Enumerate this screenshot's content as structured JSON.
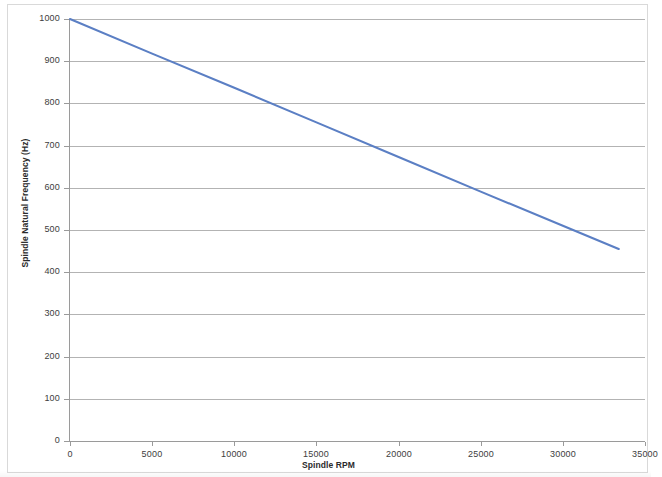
{
  "chart_data": {
    "type": "line",
    "title": "",
    "xlabel": "Spindle RPM",
    "ylabel": "Spindle Natural Frequency (Hz)",
    "xlim": [
      0,
      35000
    ],
    "ylim": [
      0,
      1000
    ],
    "grid": true,
    "legend": "none",
    "x_ticks": [
      "0",
      "5000",
      "10000",
      "15000",
      "20000",
      "25000",
      "30000",
      "35000"
    ],
    "x_tick_values": [
      0,
      5000,
      10000,
      15000,
      20000,
      25000,
      30000,
      35000
    ],
    "y_ticks": [
      "0",
      "100",
      "200",
      "300",
      "400",
      "500",
      "600",
      "700",
      "800",
      "900",
      "1000"
    ],
    "y_tick_values": [
      0,
      100,
      200,
      300,
      400,
      500,
      600,
      700,
      800,
      900,
      1000
    ],
    "series": [
      {
        "name": "Spindle Natural Frequency",
        "color": "#5B7FC4",
        "x": [
          0,
          5000,
          10000,
          15000,
          20000,
          25000,
          30000,
          33400
        ],
        "values": [
          1000,
          918,
          837,
          755,
          673,
          591,
          510,
          455
        ]
      }
    ]
  },
  "axes": {
    "y_title": "Spindle Natural Frequency (Hz)",
    "x_title": "Spindle RPM"
  },
  "style": {
    "line_color": "#5B7FC4",
    "gridline_color": "#b3b3b3",
    "axis_color": "#9a9a9a",
    "frame_color": "#d9d9d9",
    "plot_background": "#ffffff",
    "tick_label_color": "#3d3d3d"
  }
}
